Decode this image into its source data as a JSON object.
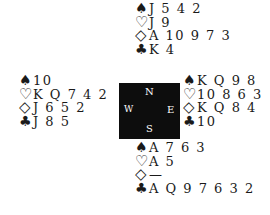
{
  "suits": {
    "spades": "♠",
    "hearts": "♡",
    "diamonds": "◇",
    "clubs": "♣"
  },
  "compass": {
    "north": "N",
    "south": "S",
    "west": "W",
    "east": "E"
  },
  "hands": {
    "north": {
      "spades": "J 5 4 2",
      "hearts": "J 9",
      "diamonds": "A 10 9 7 3",
      "clubs": "K 4"
    },
    "west": {
      "spades": "10",
      "hearts": "K Q 7 4 2",
      "diamonds": "J 6 5 2",
      "clubs": "J 8 5"
    },
    "east": {
      "spades": "K Q 9 8",
      "hearts": "10 8 6 3",
      "diamonds": "K Q 8 4",
      "clubs": "10"
    },
    "south": {
      "spades": "A 7 6 3",
      "hearts": "A 5",
      "diamonds": "—",
      "clubs": "A Q 9 7 6 3 2"
    }
  }
}
